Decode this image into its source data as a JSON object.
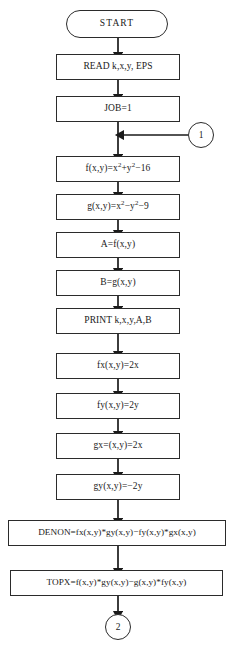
{
  "diagram": {
    "background_color": "#ffffff",
    "line_color": "#2b2b2b",
    "text_color": "#1a1a1a"
  },
  "nodes": {
    "start": {
      "label": "START",
      "shape": "terminal"
    },
    "read": {
      "label": "READ k,x,y, EPS",
      "shape": "process"
    },
    "job": {
      "label": "JOB=1",
      "shape": "process"
    },
    "f_def": {
      "shape": "process",
      "parts": {
        "p1": "f(x,y)=x",
        "sup1": "2",
        "p2": "+y",
        "sup2": "2",
        "p3": "−16"
      },
      "plain": "f(x,y)=x2+y2−16"
    },
    "g_def": {
      "shape": "process",
      "parts": {
        "p1": "g(x,y)=x",
        "sup1": "2",
        "p2": "−y",
        "sup2": "2",
        "p3": "−9"
      },
      "plain": "g(x,y)=x2−y2−9"
    },
    "a_assign": {
      "label": "A=f(x,y)",
      "shape": "process"
    },
    "b_assign": {
      "label": "B=g(x,y)",
      "shape": "process"
    },
    "print": {
      "label": "PRINT k,x,y,A,B",
      "shape": "process"
    },
    "fx": {
      "label": "fx(x,y)=2x",
      "shape": "process"
    },
    "fy": {
      "label": "fy(x,y)=2y",
      "shape": "process"
    },
    "gx": {
      "label": "gx=(x,y)=2x",
      "shape": "process"
    },
    "gy": {
      "label": "gy(x,y)=−2y",
      "shape": "process"
    },
    "denon": {
      "label": "DENON=fx(x,y)*gy(x,y)−fy(x,y)*gx(x,y)",
      "shape": "process-wide"
    },
    "topx": {
      "label": "TOPX=f(x,y)*gy(x,y)−g(x,y)*fy(x,y)",
      "shape": "process-wide"
    }
  },
  "connectors": {
    "in_one": {
      "label": "1",
      "shape": "circle",
      "position": "right"
    },
    "out_two": {
      "label": "2",
      "shape": "circle",
      "position": "bottom"
    }
  }
}
